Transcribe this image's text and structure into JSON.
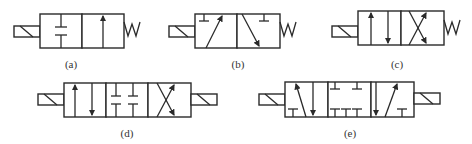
{
  "figure": {
    "colors": {
      "line": "#2a2a2a",
      "label": "#333333",
      "background": "#ffffff"
    },
    "valves": [
      {
        "id": "a",
        "label": "(a)",
        "positions": 2,
        "actuator_left": "solenoid",
        "actuator_right": "spring",
        "ports": "2/2"
      },
      {
        "id": "b",
        "label": "(b)",
        "positions": 2,
        "actuator_left": "solenoid",
        "actuator_right": "spring",
        "ports": "3/2"
      },
      {
        "id": "c",
        "label": "(c)",
        "positions": 2,
        "actuator_left": "solenoid",
        "actuator_right": "spring",
        "ports": "4/2"
      },
      {
        "id": "d",
        "label": "(d)",
        "positions": 3,
        "actuator_left": "solenoid",
        "actuator_right": "solenoid",
        "ports": "4/3"
      },
      {
        "id": "e",
        "label": "(e)",
        "positions": 3,
        "actuator_left": "solenoid",
        "actuator_right": "solenoid",
        "ports": "5/3"
      }
    ]
  }
}
